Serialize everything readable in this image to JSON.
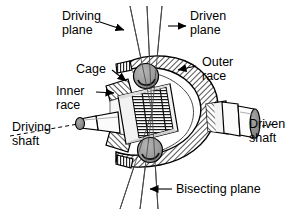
{
  "figure": {
    "title_visible": false,
    "background_color": "#ffffff",
    "ink_color": "#000000",
    "labels": {
      "driving_plane_line1": "Driving",
      "driving_plane_line2": "plane",
      "driven_plane_line1": "Driven",
      "driven_plane_line2": "plane",
      "cage": "Cage",
      "outer_race_line1": "Outer",
      "outer_race_line2": "race",
      "inner_race_line1": "Inner",
      "inner_race_line2": "race",
      "driving_shaft_line1": "Driving",
      "driving_shaft_line2": "shaft",
      "driven_shaft_line1": "Driven",
      "driven_shaft_line2": "shaft",
      "bisecting_plane": "Bisecting plane"
    },
    "colors": {
      "ball_fill": "#9a9a9a",
      "shaft_end_fill": "#8e8e8e",
      "hatch_stroke": "#1a1a1a",
      "body_fill": "#f2f2f2"
    },
    "parts": [
      "outer-race",
      "inner-race",
      "cage",
      "ball-bearing-top",
      "ball-bearing-bottom",
      "driving-shaft",
      "driven-shaft"
    ],
    "plane_lines": [
      "driving-plane",
      "bisecting-plane",
      "driven-plane"
    ]
  }
}
